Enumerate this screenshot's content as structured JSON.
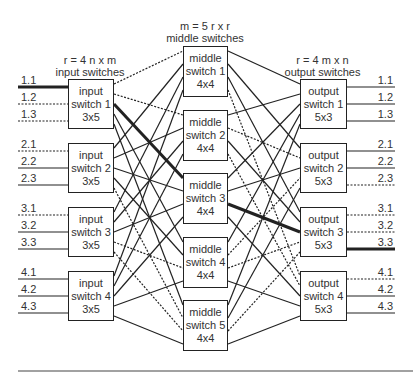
{
  "headers": {
    "input": {
      "line1": "r = 4 n x m",
      "line2": "input switches"
    },
    "middle": {
      "line1": "m = 5 r x r",
      "line2": "middle switches"
    },
    "output": {
      "line1": "r = 4 m x n",
      "line2": "output switches"
    }
  },
  "input_switches": [
    {
      "line1": "input",
      "line2": "switch 1",
      "line3": "3x5",
      "ports": [
        "1.1",
        "1.2",
        "1.3"
      ]
    },
    {
      "line1": "input",
      "line2": "switch 2",
      "line3": "3x5",
      "ports": [
        "2.1",
        "2.2",
        "2.3"
      ]
    },
    {
      "line1": "input",
      "line2": "switch 3",
      "line3": "3x5",
      "ports": [
        "3.1",
        "3.2",
        "3.3"
      ]
    },
    {
      "line1": "input",
      "line2": "switch 4",
      "line3": "3x5",
      "ports": [
        "4.1",
        "4.2",
        "4.3"
      ]
    }
  ],
  "middle_switches": [
    {
      "line1": "middle",
      "line2": "switch 1",
      "line3": "4x4"
    },
    {
      "line1": "middle",
      "line2": "switch 2",
      "line3": "4x4"
    },
    {
      "line1": "middle",
      "line2": "switch 3",
      "line3": "4x4"
    },
    {
      "line1": "middle",
      "line2": "switch 4",
      "line3": "4x4"
    },
    {
      "line1": "middle",
      "line2": "switch 5",
      "line3": "4x4"
    }
  ],
  "output_switches": [
    {
      "line1": "output",
      "line2": "switch 1",
      "line3": "5x3",
      "ports": [
        "1.1",
        "1.2",
        "1.3"
      ]
    },
    {
      "line1": "output",
      "line2": "switch 2",
      "line3": "5x3",
      "ports": [
        "2.1",
        "2.2",
        "2.3"
      ]
    },
    {
      "line1": "output",
      "line2": "switch 3",
      "line3": "5x3",
      "ports": [
        "3.1",
        "3.2",
        "3.3"
      ]
    },
    {
      "line1": "output",
      "line2": "switch 4",
      "line3": "5x3",
      "ports": [
        "4.1",
        "4.2",
        "4.3"
      ]
    }
  ],
  "highlighted_path": {
    "from": "input 1.1",
    "via": "middle switch 3",
    "to": "output 3.3"
  },
  "colors": {
    "line": "#222222",
    "text": "#333333",
    "background": "#ffffff"
  }
}
